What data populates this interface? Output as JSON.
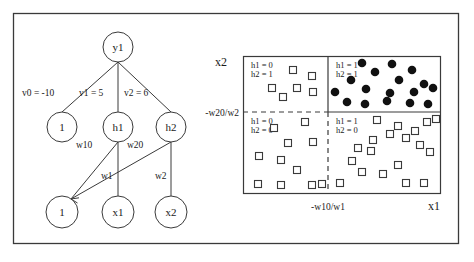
{
  "figure": {
    "frame": {
      "x": 13,
      "y": 13,
      "w": 445,
      "h": 230
    },
    "stroke_color": "#3a3a3a",
    "fill_marker_color": "#111111",
    "open_marker_color": "#ffffff"
  },
  "network": {
    "output_node": {
      "label": "y1",
      "cx": 118,
      "cy": 47,
      "r": 15
    },
    "hidden_nodes": [
      {
        "label": "1",
        "cx": 62,
        "cy": 127,
        "r": 15
      },
      {
        "label": "h1",
        "cx": 118,
        "cy": 127,
        "r": 15
      },
      {
        "label": "h2",
        "cx": 171,
        "cy": 127,
        "r": 15
      }
    ],
    "input_nodes": [
      {
        "label": "1",
        "cx": 62,
        "cy": 212,
        "r": 16
      },
      {
        "label": "x1",
        "cx": 118,
        "cy": 212,
        "r": 16
      },
      {
        "label": "x2",
        "cx": 171,
        "cy": 212,
        "r": 16
      }
    ],
    "edge_labels": [
      {
        "text": "v0 = -10",
        "x": 22,
        "y": 96
      },
      {
        "text": "v1 = 5",
        "x": 79,
        "y": 96
      },
      {
        "text": "v2 = 6",
        "x": 124,
        "y": 96
      },
      {
        "text": "w10",
        "x": 76,
        "y": 148
      },
      {
        "text": "w20",
        "x": 127,
        "y": 148
      },
      {
        "text": "w1",
        "x": 101,
        "y": 179
      },
      {
        "text": "w2",
        "x": 155,
        "y": 179
      }
    ]
  },
  "plot": {
    "box": {
      "x": 243,
      "y": 56,
      "w": 197,
      "h": 137
    },
    "v_divider_x": 328,
    "h_divider_y": 112,
    "axis_labels": {
      "y_axis": "x2",
      "x_axis": "x1",
      "y_threshold": "-w20/w2",
      "x_threshold": "-w10/w1"
    },
    "quadrants": [
      {
        "id": "top-left",
        "h1": "h1 = 0",
        "h2": "h2 = 1",
        "marker": "open-square"
      },
      {
        "id": "top-right",
        "h1": "h1 = 1",
        "h2": "h2 = 1",
        "marker": "filled-circle"
      },
      {
        "id": "bottom-left",
        "h1": "h1 = 0",
        "h2": "h2 = 0",
        "marker": "open-square"
      },
      {
        "id": "bottom-right",
        "h1": "h1 = 1",
        "h2": "h2 = 0",
        "marker": "open-square"
      }
    ]
  },
  "chart_data": {
    "type": "scatter",
    "title": "",
    "xlabel": "x1",
    "ylabel": "x2",
    "grid": false,
    "legend": null,
    "annotations": [
      "v0 = -10",
      "v1 = 5",
      "v2 = 6",
      "w10",
      "w20",
      "w1",
      "w2",
      "-w20/w2",
      "-w10/w1",
      "h1 = 0",
      "h2 = 1",
      "h1 = 1",
      "h2 = 1",
      "h1 = 0",
      "h2 = 0",
      "h1 = 1",
      "h2 = 0"
    ],
    "decision_boundaries": {
      "vertical_x": "-w10/w1",
      "horizontal_y": "-w20/w2"
    },
    "series": [
      {
        "name": "h1 = 1, h2 = 1 (filled circle)",
        "marker": "filled-circle",
        "points": [
          [
            362,
            63
          ],
          [
            392,
            64
          ],
          [
            412,
            70
          ],
          [
            375,
            72
          ],
          [
            351,
            80
          ],
          [
            399,
            80
          ],
          [
            424,
            84
          ],
          [
            335,
            92
          ],
          [
            366,
            89
          ],
          [
            390,
            93
          ],
          [
            414,
            92
          ],
          [
            433,
            88
          ],
          [
            347,
            102
          ],
          [
            365,
            104
          ],
          [
            387,
            101
          ],
          [
            410,
            103
          ],
          [
            428,
            104
          ]
        ]
      },
      {
        "name": "h1 = 0, h2 = 1 (open square)",
        "marker": "open-square",
        "points": [
          [
            293,
            70
          ],
          [
            312,
            76
          ],
          [
            272,
            88
          ],
          [
            297,
            88
          ],
          [
            313,
            92
          ],
          [
            283,
            97
          ]
        ]
      },
      {
        "name": "h1 = 0, h2 = 0 (open square)",
        "marker": "open-square",
        "points": [
          [
            305,
            122
          ],
          [
            274,
            128
          ],
          [
            288,
            143
          ],
          [
            313,
            142
          ],
          [
            259,
            156
          ],
          [
            281,
            160
          ],
          [
            297,
            170
          ],
          [
            258,
            184
          ],
          [
            281,
            185
          ],
          [
            312,
            185
          ],
          [
            322,
            184
          ]
        ]
      },
      {
        "name": "h1 = 1, h2 = 0 (open square)",
        "marker": "open-square",
        "points": [
          [
            377,
            120
          ],
          [
            427,
            122
          ],
          [
            398,
            126
          ],
          [
            415,
            131
          ],
          [
            390,
            134
          ],
          [
            406,
            138
          ],
          [
            436,
            119
          ],
          [
            373,
            140
          ],
          [
            358,
            148
          ],
          [
            371,
            151
          ],
          [
            352,
            161
          ],
          [
            398,
            165
          ],
          [
            420,
            145
          ],
          [
            430,
            152
          ],
          [
            383,
            174
          ],
          [
            406,
            183
          ],
          [
            424,
            183
          ],
          [
            340,
            183
          ],
          [
            362,
            172
          ]
        ]
      }
    ]
  }
}
